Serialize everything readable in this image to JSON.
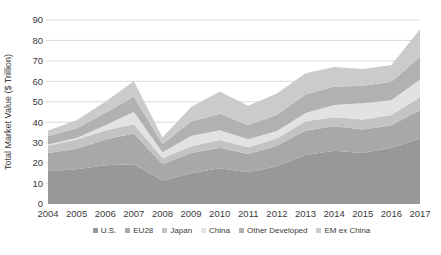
{
  "chart_data": {
    "type": "area",
    "stacked": true,
    "title": "",
    "xlabel": "",
    "ylabel": "Total Market Value ($ Trillion)",
    "ylim": [
      0,
      90
    ],
    "ytick_step": 10,
    "grid": true,
    "legend_position": "bottom",
    "x": [
      2004,
      2005,
      2006,
      2007,
      2008,
      2009,
      2010,
      2011,
      2012,
      2013,
      2014,
      2015,
      2016,
      2017
    ],
    "series": [
      {
        "name": "U.S.",
        "color": "#989898",
        "values": [
          16.0,
          17.0,
          19.0,
          19.5,
          11.5,
          15.0,
          17.5,
          15.5,
          18.5,
          24.0,
          26.0,
          25.0,
          27.5,
          32.0
        ]
      },
      {
        "name": "EU28",
        "color": "#a8a8a8",
        "values": [
          9.0,
          10.0,
          12.5,
          15.0,
          8.0,
          10.0,
          10.0,
          9.0,
          10.0,
          12.0,
          12.0,
          11.5,
          11.0,
          14.0
        ]
      },
      {
        "name": "Japan",
        "color": "#c3c3c3",
        "values": [
          3.5,
          4.5,
          4.5,
          4.5,
          3.0,
          3.3,
          3.8,
          3.3,
          3.5,
          4.5,
          4.4,
          4.8,
          5.0,
          6.2
        ]
      },
      {
        "name": "China",
        "color": "#e2e2e2",
        "values": [
          0.6,
          0.8,
          2.5,
          6.0,
          2.8,
          5.0,
          4.8,
          3.9,
          3.7,
          4.0,
          6.0,
          8.0,
          7.3,
          8.7
        ]
      },
      {
        "name": "Other Developed",
        "color": "#b1b1b1",
        "values": [
          4.0,
          4.7,
          6.0,
          7.5,
          4.0,
          7.0,
          8.0,
          7.0,
          8.0,
          9.0,
          9.0,
          8.5,
          9.0,
          11.0
        ]
      },
      {
        "name": "EM ex China",
        "color": "#cbcbcb",
        "values": [
          2.9,
          4.0,
          5.5,
          7.5,
          3.2,
          7.2,
          10.9,
          9.3,
          10.3,
          10.5,
          9.6,
          8.2,
          8.2,
          13.6
        ]
      }
    ]
  },
  "style": {
    "grid_color": "#d9d9d9",
    "text_color": "#3a3a3a",
    "divider_color": "#8e8e8e"
  }
}
